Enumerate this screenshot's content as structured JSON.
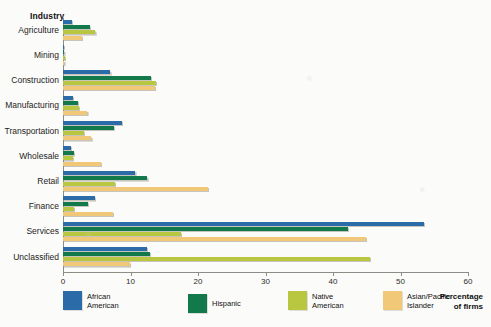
{
  "header": {
    "industry_title": "Industry",
    "percentage_title_line1": "Percentage",
    "percentage_title_line2": "of firms"
  },
  "axis": {
    "ticks": [
      0,
      10,
      20,
      30,
      40,
      50,
      60
    ],
    "tick_labels": [
      "0",
      "10",
      "20",
      "30",
      "40",
      "50",
      "60"
    ],
    "xmin": 0,
    "xmax": 60
  },
  "legend": {
    "items": [
      {
        "label_line1": "African",
        "label_line2": "American",
        "color": "#2b6ca8",
        "name": "african-american"
      },
      {
        "label_line1": "Hispanic",
        "label_line2": "",
        "color": "#127a4a",
        "name": "hispanic"
      },
      {
        "label_line1": "Native",
        "label_line2": "American",
        "color": "#b8c73f",
        "name": "native-american"
      },
      {
        "label_line1": "Asian/Pacific",
        "label_line2": "Islander",
        "color": "#f0c878",
        "name": "asian-pacific-islander"
      }
    ]
  },
  "colors": {
    "african_american": "#2b6ca8",
    "hispanic": "#127a4a",
    "native_american": "#b8c73f",
    "asian_pacific": "#f0c878",
    "axis": "#8d8d87",
    "background": "#fbfbf9",
    "shadow": "#dedbd4"
  },
  "chart_data": {
    "type": "bar",
    "orientation": "horizontal",
    "title": "",
    "xlabel": "Percentage of firms",
    "ylabel": "Industry",
    "xlim": [
      0,
      60
    ],
    "grid": false,
    "legend_position": "bottom",
    "categories": [
      "Agriculture",
      "Mining",
      "Construction",
      "Manufacturing",
      "Transportation",
      "Wholesale",
      "Retail",
      "Finance",
      "Services",
      "Unclassified"
    ],
    "series": [
      {
        "name": "African American",
        "color": "#2b6ca8",
        "values": [
          1.3,
          0.1,
          7.0,
          1.5,
          8.7,
          1.2,
          10.7,
          4.7,
          53.5,
          12.4
        ]
      },
      {
        "name": "Hispanic",
        "color": "#127a4a",
        "values": [
          4.0,
          0.2,
          13.0,
          2.2,
          7.5,
          1.6,
          12.5,
          3.7,
          42.2,
          12.9
        ]
      },
      {
        "name": "Native American",
        "color": "#b8c73f",
        "values": [
          4.8,
          0.3,
          13.8,
          2.4,
          3.1,
          1.5,
          7.7,
          1.6,
          17.5,
          45.5
        ]
      },
      {
        "name": "Asian/Pacific Islander",
        "color": "#f0c878",
        "values": [
          2.8,
          0.2,
          13.6,
          3.6,
          4.2,
          5.6,
          21.5,
          7.4,
          44.9,
          9.9
        ]
      }
    ]
  }
}
